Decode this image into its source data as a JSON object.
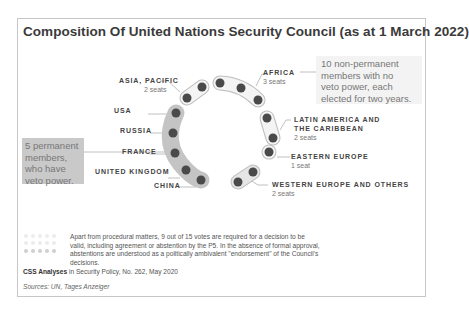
{
  "title": "Composition Of United Nations Security Council (as at 1 March 2022)",
  "colors": {
    "dot": "#4a4a4a",
    "permanent_band": "#c4c4c4",
    "nonpermanent_band": "#f1f1f1",
    "band_outline": "#bdbdbd",
    "callout_perm_bg": "#c9c9c9",
    "callout_nonperm_bg": "#f3f3f3"
  },
  "permanent_members": {
    "callout": "5 permanent members, who have veto power.",
    "callout_lines": [
      "5 permanent",
      "members,",
      "who have",
      "veto power."
    ],
    "members": [
      "USA",
      "RUSSIA",
      "FRANCE",
      "UNITED KINGDOM",
      "CHINA"
    ]
  },
  "non_permanent_members": {
    "callout": "10 non-permanent members with no veto power, each elected for two years.",
    "callout_lines": [
      "10 non-permanent",
      "members with no",
      "veto power, each",
      "elected for two years."
    ],
    "groups": [
      {
        "name": "ASIA, PACIFIC",
        "seats": "2 seats"
      },
      {
        "name": "AFRICA",
        "seats": "3 seats"
      },
      {
        "name_lines": [
          "LATIN AMERICA AND",
          "THE CARIBBEAN"
        ],
        "name": "LATIN AMERICA AND THE CARIBBEAN",
        "seats": "2 seats"
      },
      {
        "name": "EASTERN EUROPE",
        "seats": "1 seat"
      },
      {
        "name": "WESTERN EUROPE AND OTHERS",
        "seats": "2 seats"
      }
    ]
  },
  "footnote": "Apart from procedural matters, 9 out of 15 votes are required for a decision to be valid, including agreement or abstention by the P5. In the absence of formal approval, abstentions are understood as a politically ambivalent \"endorsement\" of the Council's decisions.",
  "citation": {
    "bold": "CSS Analyses",
    "rest": " in Security Policy, No. 262, May 2020"
  },
  "sources": "Sources: UN, Tages Anzeiger"
}
